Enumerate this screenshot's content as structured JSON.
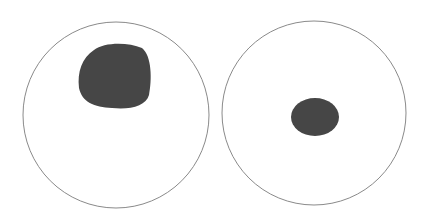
{
  "figure": {
    "background": "#ffffff",
    "outline_color": "#8a8a8a",
    "fill_color": "#464646",
    "panels": [
      {
        "id": "left",
        "circle": {
          "cx": 116,
          "cy": 115,
          "r": 93
        },
        "blob": {
          "cx": 115,
          "cy": 76,
          "rx": 36,
          "ry": 33,
          "position": "upper-center",
          "size": "large"
        }
      },
      {
        "id": "right",
        "circle": {
          "cx": 314,
          "cy": 113,
          "r": 92
        },
        "blob": {
          "cx": 315,
          "cy": 117,
          "rx": 24,
          "ry": 19,
          "position": "center",
          "size": "small"
        }
      }
    ]
  }
}
